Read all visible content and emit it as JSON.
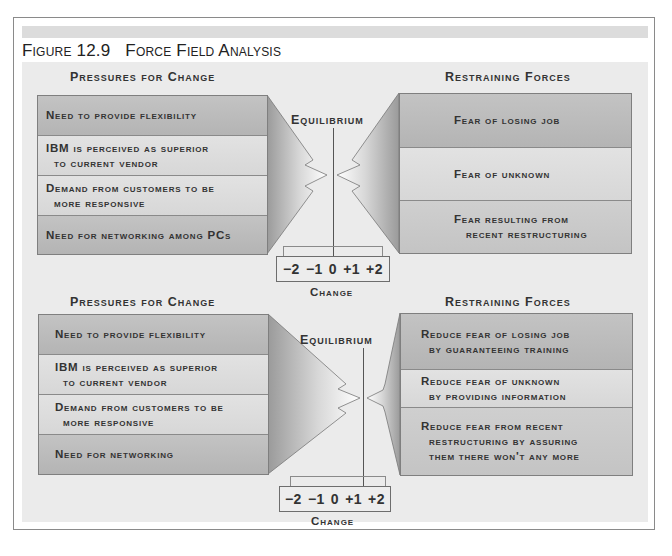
{
  "figure": {
    "number": "Figure 12.9",
    "title": "Force Field Analysis"
  },
  "diagrams": [
    {
      "pressures_header": "Pressures for Change",
      "restraining_header": "Restraining Forces",
      "equilibrium_label": "Equilibrium",
      "pressures": [
        {
          "text": "Need to provide flexibility",
          "shade": "dark"
        },
        {
          "text": "IBM is perceived as superior\n  to current vendor",
          "shade": "light"
        },
        {
          "text": "Demand from customers to be\n  more responsive",
          "shade": "light"
        },
        {
          "text": "Need for networking among PCs",
          "shade": "dark"
        }
      ],
      "restraining": [
        {
          "text": "Fear of losing job",
          "shade": "dark"
        },
        {
          "text": "Fear of unknown",
          "shade": "light"
        },
        {
          "text": "Fear resulting from\n   recent restructuring",
          "shade": "dark"
        }
      ],
      "scale": [
        "−2",
        "−1",
        "0",
        "+1",
        "+2"
      ],
      "change_label": "Change"
    },
    {
      "pressures_header": "Pressures for Change",
      "restraining_header": "Restraining Forces",
      "equilibrium_label": "Equilibrium",
      "pressures": [
        {
          "text": "Need to provide flexibility",
          "shade": "dark"
        },
        {
          "text": "IBM is perceived as superior\n  to current vendor",
          "shade": "light"
        },
        {
          "text": "Demand from customers to be\n  more responsive",
          "shade": "light"
        },
        {
          "text": "Need for networking",
          "shade": "dark"
        }
      ],
      "restraining": [
        {
          "text": "Reduce fear of losing job\n  by guaranteeing training",
          "shade": "dark"
        },
        {
          "text": "Reduce fear of unknown\n  by providing information",
          "shade": "light"
        },
        {
          "text": "Reduce fear from recent\n  restructuring by assuring\n  them there won't any more",
          "shade": "dark"
        }
      ],
      "scale": [
        "−2",
        "−1",
        "0",
        "+1",
        "+2"
      ],
      "change_label": "Change"
    }
  ]
}
